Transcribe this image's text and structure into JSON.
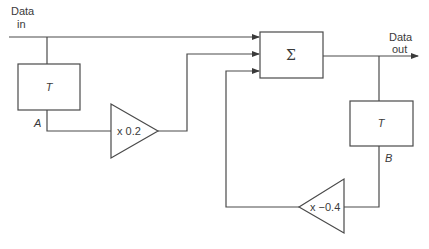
{
  "diagram": {
    "type": "block-diagram",
    "title": "",
    "input": {
      "label_line1": "Data",
      "label_line2": "in"
    },
    "output": {
      "label_line1": "Data",
      "label_line2": "out"
    },
    "blocks": [
      {
        "id": "delay_a",
        "kind": "delay",
        "label": "T",
        "node_label": "A"
      },
      {
        "id": "gain_a",
        "kind": "gain",
        "label": "x 0.2"
      },
      {
        "id": "sum",
        "kind": "summer",
        "label": "Σ"
      },
      {
        "id": "delay_b",
        "kind": "delay",
        "label": "T",
        "node_label": "B"
      },
      {
        "id": "gain_b",
        "kind": "gain",
        "label": "x −0.4"
      }
    ],
    "connections": [
      {
        "from": "input",
        "to": "sum"
      },
      {
        "from": "input",
        "to": "delay_a"
      },
      {
        "from": "delay_a",
        "to": "gain_a"
      },
      {
        "from": "gain_a",
        "to": "sum"
      },
      {
        "from": "sum",
        "to": "output"
      },
      {
        "from": "sum",
        "to": "delay_b"
      },
      {
        "from": "delay_b",
        "to": "gain_b"
      },
      {
        "from": "gain_b",
        "to": "sum"
      }
    ],
    "colors": {
      "line": "#4a4a4a",
      "text": "#3a3a3a",
      "background": "#ffffff"
    }
  }
}
